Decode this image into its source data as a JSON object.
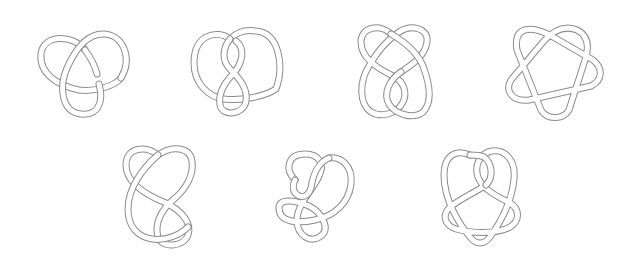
{
  "diagram": {
    "type": "knot-table",
    "rows": 2,
    "knots": [
      {
        "id": "knot-1",
        "name": "trefoil",
        "crossings": 3,
        "row": 1,
        "x": 37,
        "y": 28,
        "w": 96,
        "h": 90
      },
      {
        "id": "knot-2",
        "name": "figure-eight",
        "crossings": 4,
        "row": 1,
        "x": 190,
        "y": 27,
        "w": 94,
        "h": 91
      },
      {
        "id": "knot-3",
        "name": "five-crossing-twist",
        "crossings": 5,
        "row": 1,
        "x": 357,
        "y": 22,
        "w": 76,
        "h": 100
      },
      {
        "id": "knot-4",
        "name": "cinquefoil",
        "crossings": 5,
        "row": 1,
        "x": 503,
        "y": 20,
        "w": 102,
        "h": 101
      },
      {
        "id": "knot-5",
        "name": "six-crossing-a",
        "crossings": 6,
        "row": 2,
        "x": 122,
        "y": 143,
        "w": 76,
        "h": 109
      },
      {
        "id": "knot-6",
        "name": "six-crossing-b",
        "crossings": 6,
        "row": 2,
        "x": 275,
        "y": 150,
        "w": 80,
        "h": 97
      },
      {
        "id": "knot-7",
        "name": "six-crossing-c",
        "crossings": 6,
        "row": 2,
        "x": 440,
        "y": 145,
        "w": 82,
        "h": 102
      }
    ],
    "colors": {
      "background": "#ffffff",
      "tube_outline": "#8c8c8c",
      "tube_fill": "#ffffff"
    }
  }
}
